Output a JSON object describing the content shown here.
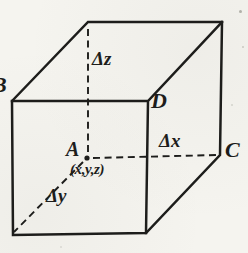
{
  "figure": {
    "labels": {
      "vertex_a": "A",
      "vertex_b": "B",
      "vertex_c": "C",
      "vertex_d": "D",
      "point_coords": "(x,y,z)",
      "delta_x": "Δx",
      "delta_y": "Δy",
      "delta_z": "Δz"
    },
    "colors": {
      "paper": "#f5f4ef",
      "ink": "#1d1d1b"
    }
  }
}
